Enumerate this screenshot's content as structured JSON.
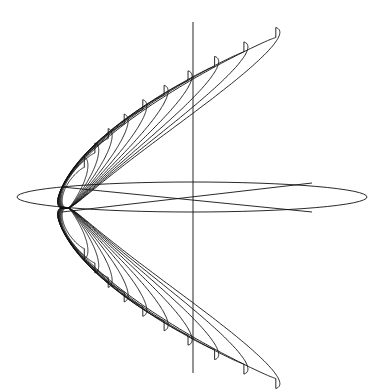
{
  "figure": {
    "type": "3d-wireframe-lobes",
    "stroke_color": "#111111",
    "background": "#ffffff",
    "apex": [
      68,
      208
    ],
    "axis_line": {
      "x": 193,
      "y1": 22,
      "y2": 373
    },
    "ground_ellipse": {
      "cx": 192,
      "cy": 197,
      "rx": 175,
      "ry": 15
    },
    "cross_lines": [
      [
        62,
        187,
        312,
        212
      ],
      [
        62,
        212,
        312,
        183
      ]
    ],
    "lobe_count": 10,
    "lobe_scale": [
      0.28,
      0.36,
      0.44,
      0.52,
      0.6,
      0.68,
      0.76,
      0.84,
      0.92,
      1.0
    ]
  }
}
